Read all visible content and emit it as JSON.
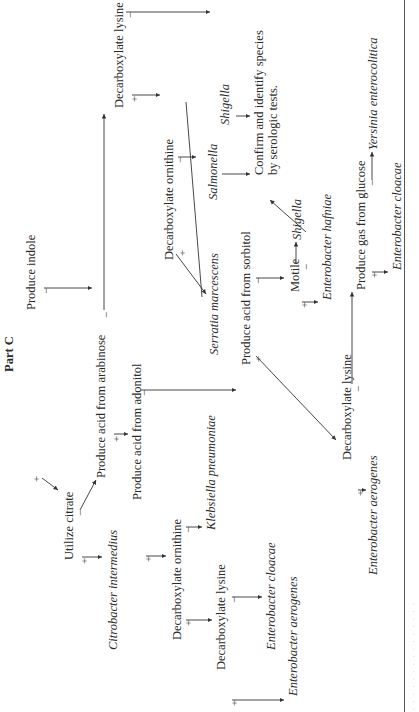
{
  "title": "Part C",
  "nodes": {
    "produce_indole": "Produce indole",
    "utilize_citrate": "Utilize citrate",
    "acid_arabinose": "Produce acid from arabinose",
    "citrobacter": "Citrobacter intermedius",
    "acid_adonitol": "Produce acid from adonitol",
    "decarb_lysine_top": "Decarboxylate lysine",
    "decarb_ornithine_right": "Decarboxylate ornithine",
    "decarb_ornithine_left": "Decarboxylate ornithine",
    "klebsiella": "Klebsiella pneumoniae",
    "salmonella": "Salmonella",
    "shigella_top": "Shigella",
    "confirm_line1": "Confirm and identify species",
    "confirm_line2": "by serologic tests.",
    "serratia": "Serratia marcescens",
    "acid_sorbitol": "Produce acid from sorbitol",
    "decarb_lysine_left": "Decarboxylate lysine",
    "ent_cloacae_left": "Enterobacter cloacae",
    "ent_aerogenes_left": "Enterobacter aerogenes",
    "motile": "Motile",
    "shigella_mid": "Shigella",
    "ent_hafniae": "Enterobacter hafniae",
    "decarb_lysine_bottom": "Decarboxylate lysine",
    "gas_glucose": "Produce gas from glucose",
    "yersinia": "Yersinia enterocolitica",
    "ent_aerogenes_bottom": "Enterobacter aerogenes",
    "ent_cloacae_bottom": "Enterobacter cloacae"
  },
  "signs": {
    "plus": "+",
    "minus": "−"
  }
}
